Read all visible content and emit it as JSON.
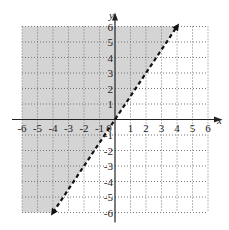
{
  "chart_data": {
    "type": "line",
    "title": "",
    "xlabel": "x",
    "ylabel": "y",
    "xlim": [
      -6,
      6
    ],
    "ylim": [
      -6,
      6
    ],
    "grid": true,
    "grid_style": "dotted",
    "x_ticks": [
      -6,
      -5,
      -4,
      -3,
      -2,
      -1,
      0,
      1,
      2,
      3,
      4,
      5,
      6
    ],
    "y_ticks": [
      -6,
      -5,
      -4,
      -3,
      -2,
      -1,
      1,
      2,
      3,
      4,
      5,
      6
    ],
    "x_tick_labels": [
      "-6",
      "-5",
      "-4",
      "-3",
      "-2",
      "-1",
      "0",
      "1",
      "2",
      "3",
      "4",
      "5",
      "6"
    ],
    "y_tick_labels": [
      "-6",
      "-5",
      "-4",
      "-3",
      "-2",
      "-1",
      "1",
      "2",
      "3",
      "4",
      "5",
      "6"
    ],
    "boundary_line": {
      "equation": "y = 1.5x",
      "style": "dashed",
      "arrows": "both",
      "points": [
        [
          -4,
          -6
        ],
        [
          0,
          0
        ],
        [
          4,
          6
        ]
      ]
    },
    "shaded_region": {
      "side": "above-left of line",
      "inequality": "y > 1.5x",
      "color": "#d4d4d4"
    },
    "legend": null
  },
  "labels": {
    "x_axis": "x",
    "y_axis": "y",
    "origin": "0"
  },
  "colors": {
    "shade": "#d4d4d4",
    "axis": "#222222",
    "grid": "#777777",
    "line": "#111111"
  }
}
